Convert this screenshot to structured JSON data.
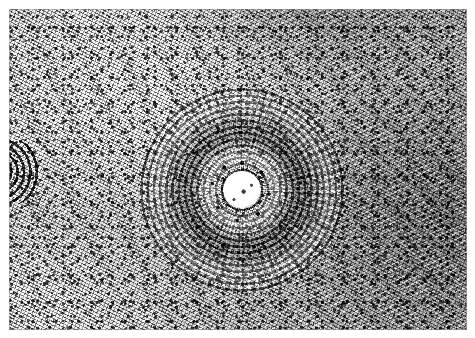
{
  "image": {
    "kind": "histopathology-micrograph",
    "staining": "hematoxylin-and-eosin (reproduced in grayscale)",
    "modality": "light-microscopy-photomicrograph",
    "color_mode": "grayscale",
    "caption": "",
    "scale_bar": "",
    "annotations": [],
    "width_px": 475,
    "height_px": 338
  },
  "plate": {
    "margin_px": 9,
    "inner_width_px": 458,
    "inner_height_px": 321,
    "paper_color": "#ffffff",
    "mid_tone_color": "#b9b9b9",
    "darkest_color": "#0c0c0c",
    "lightest_color": "#fdfdfd"
  },
  "features": {
    "background": {
      "name": "dense-spindle-cell-stroma",
      "description": "Diffuse, densely cellular fibrous stroma of interlacing spindle cells with small dark elongated nuclei; brighter toward the upper-left and lower-left, denser and darker toward the right margin.",
      "tone": "#c4c4c4"
    },
    "primary_whorl": {
      "name": "concentric-whorled-structure",
      "description": "Large rounded lesion formed by many tightly packed concentric lamellae of spindle cells, producing an onion-skin pattern around a central bright lumen.",
      "center_x_px": 242,
      "center_y_px": 190,
      "radius_px": 104,
      "ring_count_estimate": 16
    },
    "lumen": {
      "name": "central-lumen",
      "description": "Bright, nearly acellular central space ringed and speckled by clumped dark nuclei.",
      "center_x_px": 242,
      "center_y_px": 190,
      "radius_px": 19,
      "fill": "#fdfdfd"
    },
    "nuclear_collar": {
      "name": "perilumenal-nuclear-collar",
      "description": "Dark band of condensed nuclei immediately surrounding the bright lumen.",
      "inner_radius_px": 18,
      "outer_radius_px": 40
    },
    "secondary_whorl": {
      "name": "secondary-whorl-clipped-at-left-edge",
      "description": "A second, smaller concentric whorl cut off by the left border of the field.",
      "center_x_px": 8,
      "center_y_px": 172,
      "radius_px": 34
    }
  }
}
